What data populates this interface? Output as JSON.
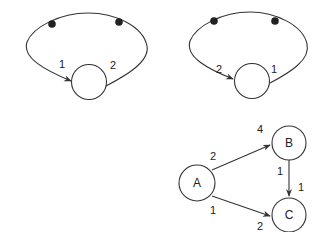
{
  "colors": {
    "stroke": "#333333",
    "dot": "#222222",
    "background": "#ffffff",
    "text": "#222222"
  },
  "graph_left": {
    "edge_labels": {
      "incoming": "1",
      "outgoing": "2"
    }
  },
  "graph_right": {
    "edge_labels": {
      "incoming": "2",
      "outgoing": "1"
    }
  },
  "graph_bottom": {
    "nodes": {
      "a": "A",
      "b": "B",
      "c": "C"
    },
    "edges": {
      "a_b": {
        "tail": "2",
        "head": "4"
      },
      "b_c": {
        "tail": "1",
        "head": "1"
      },
      "a_c": {
        "tail": "1",
        "head": "2"
      }
    }
  }
}
